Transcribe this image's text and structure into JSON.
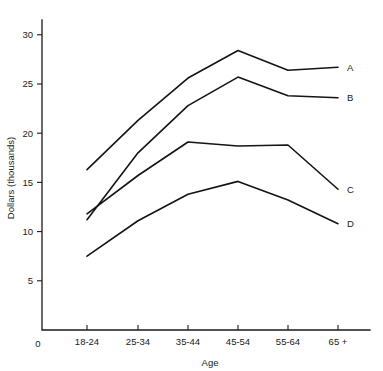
{
  "chart_data": {
    "type": "line",
    "title": "",
    "xlabel": "Age",
    "ylabel": "Dollars (thousands)",
    "categories": [
      "18-24",
      "25-34",
      "35-44",
      "45-54",
      "55-64",
      "65 +"
    ],
    "ylim": [
      0,
      31.5
    ],
    "yticks": [
      5,
      10,
      15,
      20,
      25,
      30
    ],
    "ytick_labels": [
      "5",
      "10",
      "15",
      "20",
      "25",
      "30"
    ],
    "origin_label": "0",
    "grid": false,
    "legend": "right-inline-labels",
    "series": [
      {
        "name": "A",
        "label": "A",
        "values": [
          16.3,
          21.3,
          25.6,
          28.4,
          26.4,
          26.7
        ]
      },
      {
        "name": "B",
        "label": "B",
        "values": [
          11.2,
          18.0,
          22.8,
          25.7,
          23.8,
          23.6
        ]
      },
      {
        "name": "C",
        "label": "C",
        "values": [
          11.8,
          15.7,
          19.1,
          18.7,
          18.8,
          14.3
        ]
      },
      {
        "name": "D",
        "label": "D",
        "values": [
          7.5,
          11.1,
          13.8,
          15.1,
          13.2,
          10.8
        ]
      }
    ]
  },
  "colors": {
    "line": "#141414",
    "axis": "#1a1a1a",
    "background": "#ffffff"
  }
}
